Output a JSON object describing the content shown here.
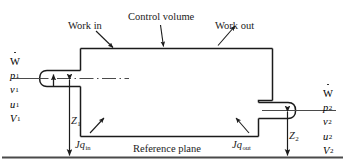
{
  "diagram": {
    "annotations": {
      "control_volume": "Control volume",
      "work_in": "Work in",
      "work_out": "Work out",
      "reference_plane": "Reference plane"
    },
    "heat": {
      "in_symbol": "J",
      "in_var": "q",
      "in_sub": "in",
      "in_full": "Jq_in",
      "out_symbol": "J",
      "out_var": "q",
      "out_sub": "out",
      "out_full": "Jq_out"
    },
    "heights": {
      "z1_var": "Z",
      "z1_sub": "1",
      "z2_var": "Z",
      "z2_sub": "2"
    },
    "inlet_state": {
      "work_symbol": "W",
      "work_sub": "",
      "properties": [
        {
          "var": "p",
          "sub": "1"
        },
        {
          "var": "v",
          "sub": "1"
        },
        {
          "var": "u",
          "sub": "1"
        },
        {
          "var": "V",
          "sub": "1"
        }
      ]
    },
    "outlet_state": {
      "work_symbol": "W",
      "work_sub": "",
      "properties": [
        {
          "var": "p",
          "sub": "2"
        },
        {
          "var": "v",
          "sub": "2"
        },
        {
          "var": "u",
          "sub": "2"
        },
        {
          "var": "V",
          "sub": "2"
        }
      ]
    },
    "colors": {
      "line": "#1b1b1b",
      "text": "#1b1b1b",
      "background": "#ffffff",
      "reference_line": "#4a4a4a",
      "centerline": "#4a4a4a"
    }
  }
}
